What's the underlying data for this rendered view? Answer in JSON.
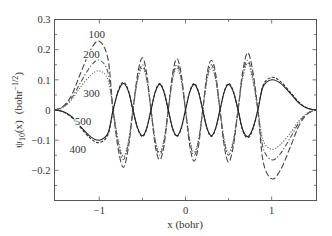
{
  "chart_data": {
    "type": "line",
    "title": "",
    "xlabel": "x (bohr)",
    "ylabel": "ψ10(x)  (bohr^-1/2)",
    "ylabel_parts": {
      "psi": "ψ",
      "sub": "10",
      "arg": "(x)",
      "unit_open": "(bohr",
      "unit_sup": "−1/2",
      "unit_close": ")"
    },
    "xlim": [
      -1.52,
      1.52
    ],
    "ylim": [
      -0.3,
      0.3
    ],
    "xticks": [
      -1,
      0,
      1
    ],
    "xtick_labels": [
      "−1",
      "0",
      "1"
    ],
    "xminor_ticks": [
      -0.5,
      0.5
    ],
    "yticks": [
      -0.2,
      -0.1,
      0,
      0.1,
      0.2,
      0.3
    ],
    "ytick_labels": [
      "−0.2",
      "−0.1",
      "0",
      "0.1",
      "0.2",
      "0.3"
    ],
    "yminor_ticks": [
      -0.25,
      -0.15,
      -0.05,
      0.05,
      0.15,
      0.25
    ],
    "grid": false,
    "legend": "inline labels",
    "x": [
      -1.52,
      -1.42,
      -1.32,
      -1.22,
      -1.1,
      -1.0,
      -0.9,
      -0.84,
      -0.78,
      -0.72,
      -0.66,
      -0.61,
      -0.555,
      -0.5,
      -0.45,
      -0.4,
      -0.35,
      -0.3,
      -0.25,
      -0.2,
      -0.15,
      -0.1,
      -0.05,
      0,
      0.05,
      0.1,
      0.15,
      0.2,
      0.25,
      0.3,
      0.35,
      0.4,
      0.45,
      0.5,
      0.555,
      0.61,
      0.66,
      0.72,
      0.78,
      0.84,
      0.9,
      1.0,
      1.1,
      1.22,
      1.32,
      1.42,
      1.52
    ],
    "series": [
      {
        "name": "100",
        "style": "long-dash",
        "color": "#444444",
        "values": [
          0,
          0.012,
          0.05,
          0.12,
          0.2,
          0.228,
          0.17,
          0,
          -0.13,
          -0.19,
          -0.12,
          0,
          0.12,
          0.173,
          0.12,
          0,
          -0.12,
          -0.165,
          -0.12,
          0,
          0.12,
          0.17,
          0.12,
          0,
          -0.12,
          -0.17,
          -0.12,
          0,
          0.12,
          0.165,
          0.12,
          0,
          -0.12,
          -0.173,
          -0.12,
          0,
          0.12,
          0.19,
          0.13,
          0,
          -0.17,
          -0.228,
          -0.2,
          -0.12,
          -0.05,
          -0.012,
          0
        ]
      },
      {
        "name": "200",
        "style": "dash-dot",
        "color": "#555555",
        "values": [
          0,
          0.01,
          0.04,
          0.09,
          0.145,
          0.165,
          0.125,
          0,
          -0.11,
          -0.165,
          -0.105,
          0,
          0.105,
          0.15,
          0.105,
          0,
          -0.105,
          -0.15,
          -0.105,
          0,
          0.105,
          0.15,
          0.105,
          0,
          -0.105,
          -0.15,
          -0.105,
          0,
          0.105,
          0.15,
          0.105,
          0,
          -0.105,
          -0.15,
          -0.105,
          0,
          0.11,
          0.165,
          0.11,
          0,
          -0.125,
          -0.165,
          -0.145,
          -0.09,
          -0.04,
          -0.01,
          0
        ]
      },
      {
        "name": "300",
        "style": "dotted",
        "color": "#666666",
        "values": [
          0,
          0.009,
          0.034,
          0.075,
          0.115,
          0.13,
          0.1,
          0,
          -0.1,
          -0.155,
          -0.1,
          0,
          0.1,
          0.14,
          0.1,
          0,
          -0.1,
          -0.14,
          -0.1,
          0,
          0.1,
          0.14,
          0.1,
          0,
          -0.1,
          -0.14,
          -0.1,
          0,
          0.1,
          0.14,
          0.1,
          0,
          -0.1,
          -0.14,
          -0.1,
          0,
          0.1,
          0.155,
          0.1,
          0,
          -0.1,
          -0.13,
          -0.115,
          -0.075,
          -0.034,
          -0.009,
          0
        ]
      },
      {
        "name": "400",
        "style": "short-dash",
        "color": "#333333",
        "values": [
          0,
          -0.006,
          -0.025,
          -0.058,
          -0.095,
          -0.108,
          -0.082,
          0,
          0.065,
          0.092,
          0.062,
          0,
          -0.062,
          -0.088,
          -0.062,
          0,
          0.062,
          0.088,
          0.062,
          0,
          -0.062,
          -0.088,
          -0.062,
          0,
          0.062,
          0.088,
          0.062,
          0,
          -0.062,
          -0.088,
          -0.062,
          0,
          0.062,
          0.088,
          0.062,
          0,
          -0.065,
          -0.092,
          -0.065,
          0,
          0.082,
          0.108,
          0.095,
          0.058,
          0.025,
          0.006,
          0
        ]
      },
      {
        "name": "500",
        "style": "solid",
        "color": "#222222",
        "values": [
          0,
          -0.005,
          -0.022,
          -0.054,
          -0.089,
          -0.1,
          -0.077,
          0,
          0.062,
          0.088,
          0.06,
          0,
          -0.06,
          -0.085,
          -0.06,
          0,
          0.06,
          0.085,
          0.06,
          0,
          -0.06,
          -0.085,
          -0.06,
          0,
          0.06,
          0.085,
          0.06,
          0,
          -0.06,
          -0.085,
          -0.06,
          0,
          0.06,
          0.085,
          0.06,
          0,
          -0.062,
          -0.088,
          -0.062,
          0,
          0.077,
          0.1,
          0.089,
          0.054,
          0.022,
          0.005,
          0
        ]
      }
    ],
    "annotations": [
      {
        "text": "100",
        "x": -1.03,
        "y": 0.253
      },
      {
        "text": "200",
        "x": -1.09,
        "y": 0.187
      },
      {
        "text": "300",
        "x": -1.09,
        "y": 0.055
      },
      {
        "text": "500",
        "x": -1.19,
        "y": -0.037
      },
      {
        "text": "400",
        "x": -1.25,
        "y": -0.13
      }
    ]
  }
}
